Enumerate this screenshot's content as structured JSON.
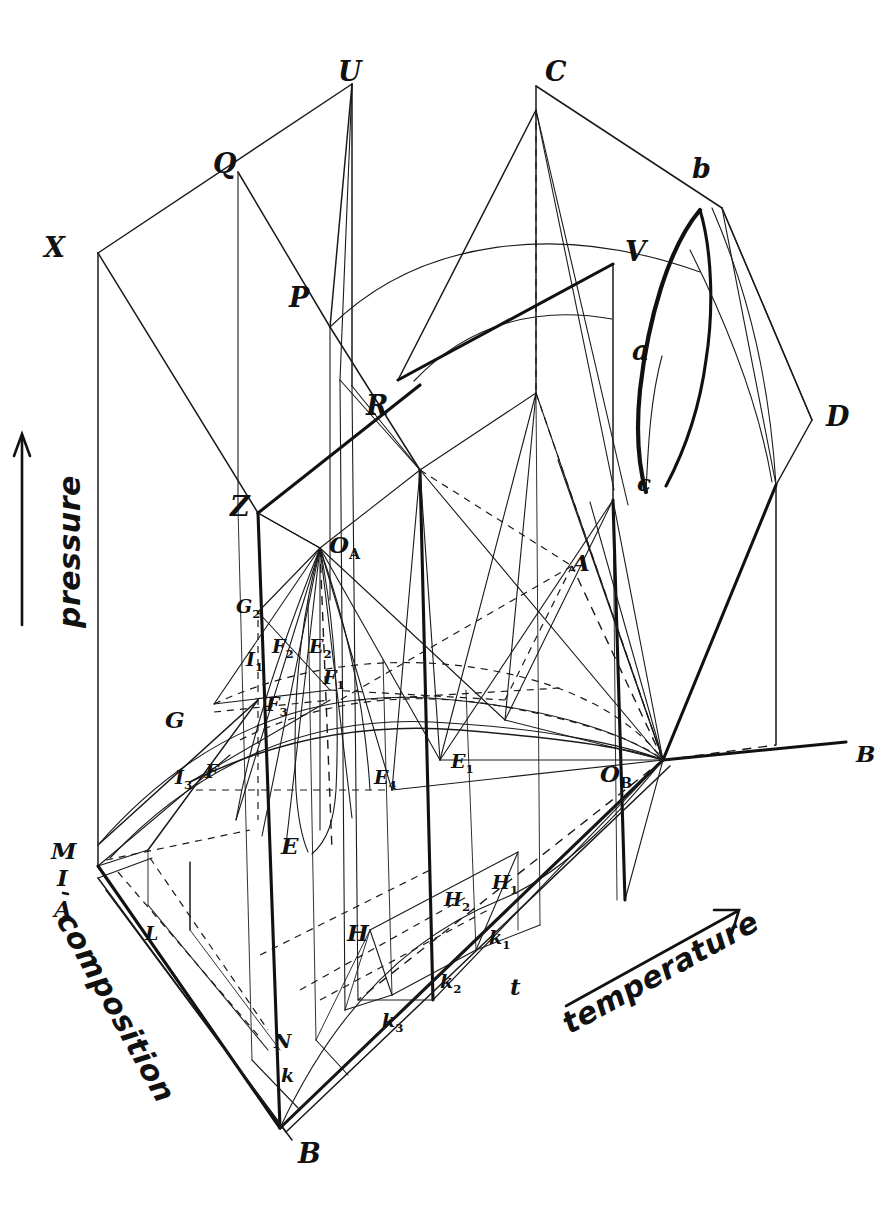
{
  "figure": {
    "kind": "hand-drawn 3D pressure-temperature-composition phase diagram",
    "background_color": "#ffffff",
    "ink_color": "#111111",
    "width": 890,
    "height": 1228
  },
  "axes": {
    "pressure": {
      "label": "pressure",
      "direction": "up"
    },
    "temperature": {
      "label": "temperature",
      "direction": "up-right"
    },
    "composition": {
      "label": "composition",
      "direction": "down-right"
    }
  },
  "vertex_labels": {
    "X": "X",
    "Q": "Q",
    "U": "U",
    "C": "C",
    "P": "P",
    "V": "V",
    "b": "b",
    "a": "a",
    "c": "c",
    "D": "D",
    "R": "R",
    "Z": "Z",
    "OA": "O",
    "OA_sub": "A",
    "OB": "O",
    "OB_sub": "B",
    "A_upper": "A",
    "B_right": "B",
    "G": "G",
    "G2": "G",
    "G2_sub": "2",
    "I1": "I",
    "I1_sub": "1",
    "I3": "I",
    "I3_sub": "3",
    "F": "F",
    "F1": "F",
    "F1_sub": "1",
    "F2": "F",
    "F2_sub": "2",
    "F3": "F",
    "F3_sub": "3",
    "E": "E",
    "E1": "E",
    "E1_sub": "1",
    "E2": "E",
    "E2_sub": "2",
    "E4": "E",
    "E4_sub": "4",
    "H": "H",
    "H1": "H",
    "H1_sub": "1",
    "H2": "H",
    "H2_sub": "2",
    "k": "k",
    "k1": "k",
    "k1_sub": "1",
    "k2": "k",
    "k2_sub": "2",
    "k3": "k",
    "k3_sub": "3",
    "t": "t",
    "N": "N",
    "L": "L",
    "M": "M",
    "I_left": "I",
    "A_left": "A",
    "B_bottom": "B"
  },
  "labels_list": [
    {
      "name": "X",
      "text": "X",
      "x": 44,
      "y": 234,
      "size": "lg"
    },
    {
      "name": "Q",
      "text": "Q",
      "x": 213,
      "y": 150,
      "size": "lg"
    },
    {
      "name": "U",
      "text": "U",
      "x": 338,
      "y": 58,
      "size": "lg"
    },
    {
      "name": "C",
      "text": "C",
      "x": 545,
      "y": 58,
      "size": "lg"
    },
    {
      "name": "P",
      "text": "P",
      "x": 289,
      "y": 284,
      "size": "lg"
    },
    {
      "name": "V",
      "text": "V",
      "x": 625,
      "y": 238,
      "size": "lg"
    },
    {
      "name": "b",
      "text": "b",
      "x": 692,
      "y": 155,
      "size": "lg"
    },
    {
      "name": "a",
      "text": "a",
      "x": 632,
      "y": 337,
      "size": "lg"
    },
    {
      "name": "c",
      "text": "c",
      "x": 637,
      "y": 471,
      "size": "md"
    },
    {
      "name": "D",
      "text": "D",
      "x": 826,
      "y": 403,
      "size": "lg"
    },
    {
      "name": "R",
      "text": "R",
      "x": 366,
      "y": 392,
      "size": "lg"
    },
    {
      "name": "Z",
      "text": "Z",
      "x": 230,
      "y": 493,
      "size": "lg"
    },
    {
      "name": "A-upper",
      "text": "A",
      "x": 572,
      "y": 551,
      "size": "md"
    },
    {
      "name": "B-right",
      "text": "B",
      "x": 856,
      "y": 742,
      "size": "md"
    },
    {
      "name": "G",
      "text": "G",
      "x": 165,
      "y": 708,
      "size": "md"
    },
    {
      "name": "E",
      "text": "E",
      "x": 281,
      "y": 834,
      "size": "md"
    },
    {
      "name": "H",
      "text": "H",
      "x": 347,
      "y": 921,
      "size": "md"
    },
    {
      "name": "N",
      "text": "N",
      "x": 274,
      "y": 1032,
      "size": "sm"
    },
    {
      "name": "K",
      "text": "k",
      "x": 281,
      "y": 1066,
      "size": "sm"
    },
    {
      "name": "B-bottom",
      "text": "B",
      "x": 298,
      "y": 1140,
      "size": "lg"
    },
    {
      "name": "L",
      "text": "L",
      "x": 145,
      "y": 924,
      "size": "sm"
    },
    {
      "name": "M",
      "text": "M",
      "x": 51,
      "y": 839,
      "size": "md"
    },
    {
      "name": "I-left",
      "text": "I",
      "x": 57,
      "y": 866,
      "size": "md"
    },
    {
      "name": "A-left",
      "text": "A",
      "x": 54,
      "y": 897,
      "size": "md"
    },
    {
      "name": "t",
      "text": "t",
      "x": 510,
      "y": 975,
      "size": "md"
    }
  ],
  "subscript_labels": [
    {
      "name": "O-A",
      "base": "O",
      "sub": "A",
      "x": 329,
      "y": 533,
      "size": "md"
    },
    {
      "name": "O-B",
      "base": "O",
      "sub": "B",
      "x": 600,
      "y": 762,
      "size": "md"
    },
    {
      "name": "G-2",
      "base": "G",
      "sub": "2",
      "x": 236,
      "y": 597,
      "size": "sm"
    },
    {
      "name": "I-1",
      "base": "I",
      "sub": "1",
      "x": 246,
      "y": 650,
      "size": "sm"
    },
    {
      "name": "F-2",
      "base": "F",
      "sub": "2",
      "x": 272,
      "y": 637,
      "size": "sm"
    },
    {
      "name": "E-2",
      "base": "E",
      "sub": "2",
      "x": 309,
      "y": 637,
      "size": "sm"
    },
    {
      "name": "F-1",
      "base": "F",
      "sub": "1",
      "x": 323,
      "y": 668,
      "size": "sm"
    },
    {
      "name": "F-3",
      "base": "F",
      "sub": "3",
      "x": 266,
      "y": 695,
      "size": "sm"
    },
    {
      "name": "I-3",
      "base": "I",
      "sub": "3",
      "x": 175,
      "y": 768,
      "size": "sm"
    },
    {
      "name": "F",
      "base": "F",
      "sub": "",
      "x": 205,
      "y": 762,
      "size": "sm"
    },
    {
      "name": "E-4",
      "base": "E",
      "sub": "4",
      "x": 374,
      "y": 768,
      "size": "sm"
    },
    {
      "name": "E-1",
      "base": "E",
      "sub": "1",
      "x": 451,
      "y": 752,
      "size": "sm"
    },
    {
      "name": "H-1",
      "base": "H",
      "sub": "1",
      "x": 492,
      "y": 873,
      "size": "sm"
    },
    {
      "name": "H-2",
      "base": "H",
      "sub": "2",
      "x": 444,
      "y": 890,
      "size": "sm"
    },
    {
      "name": "k-1",
      "base": "k",
      "sub": "1",
      "x": 489,
      "y": 928,
      "size": "sm"
    },
    {
      "name": "k-2",
      "base": "k",
      "sub": "2",
      "x": 440,
      "y": 972,
      "size": "sm"
    },
    {
      "name": "k-3",
      "base": "k",
      "sub": "3",
      "x": 382,
      "y": 1011,
      "size": "sm"
    }
  ]
}
